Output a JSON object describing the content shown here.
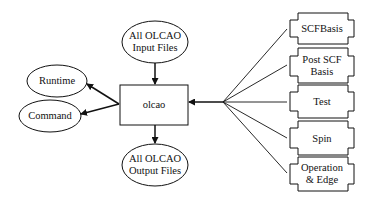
{
  "diagram": {
    "center_node": {
      "label": "olcao"
    },
    "input_node": {
      "label_line1": "All OLCAO",
      "label_line2": "Input Files"
    },
    "output_node": {
      "label_line1": "All OLCAO",
      "label_line2": "Output Files"
    },
    "left_nodes": [
      {
        "label": "Runtime"
      },
      {
        "label": "Command"
      }
    ],
    "right_modules": [
      {
        "label_line1": "SCFBasis",
        "label_line2": ""
      },
      {
        "label_line1": "Post SCF",
        "label_line2": "Basis"
      },
      {
        "label_line1": "Test",
        "label_line2": ""
      },
      {
        "label_line1": "Spin",
        "label_line2": ""
      },
      {
        "label_line1": "Operation",
        "label_line2": "& Edge"
      }
    ],
    "edges": [
      {
        "from": "All OLCAO Input Files",
        "to": "olcao"
      },
      {
        "from": "olcao",
        "to": "All OLCAO Output Files"
      },
      {
        "from": "olcao",
        "to": "Runtime"
      },
      {
        "from": "olcao",
        "to": "Command"
      },
      {
        "from": "SCFBasis",
        "to": "olcao"
      },
      {
        "from": "Post SCF Basis",
        "to": "olcao"
      },
      {
        "from": "Test",
        "to": "olcao"
      },
      {
        "from": "Spin",
        "to": "olcao"
      },
      {
        "from": "Operation & Edge",
        "to": "olcao"
      }
    ]
  }
}
